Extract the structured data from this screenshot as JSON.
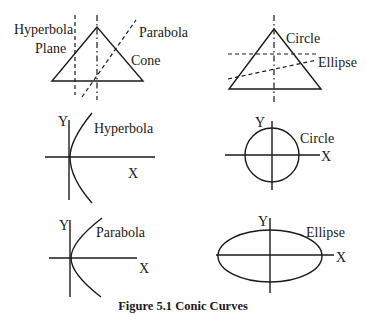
{
  "figure": {
    "caption": "Figure 5.1 Conic Curves",
    "panels": {
      "cone_left": {
        "labels": {
          "hyperbola": "Hyperbola",
          "plane": "Plane",
          "parabola": "Parabola",
          "cone": "Cone"
        }
      },
      "cone_right": {
        "labels": {
          "circle": "Circle",
          "ellipse": "Ellipse"
        }
      },
      "hyperbola_plot": {
        "y_label": "Y",
        "x_label": "X",
        "curve_label": "Hyperbola"
      },
      "circle_plot": {
        "y_label": "Y",
        "x_label": "X",
        "curve_label": "Circle"
      },
      "parabola_plot": {
        "y_label": "Y",
        "x_label": "X",
        "curve_label": "Parabola"
      },
      "ellipse_plot": {
        "y_label": "Y",
        "x_label": "X",
        "curve_label": "Ellipse"
      }
    }
  },
  "colors": {
    "ink": "#1a1a1a",
    "background": "#ffffff"
  }
}
